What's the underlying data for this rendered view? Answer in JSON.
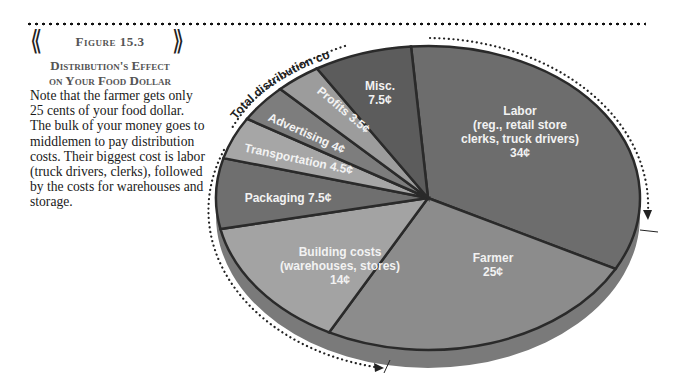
{
  "figure": {
    "label": "Figure 15.3",
    "title_line1": "Distribution's Effect",
    "title_line2": "on Your Food Dollar",
    "body": "Note that the farmer gets only 25 cents of your food dollar. The bulk of your money goes to middlemen to pay distribution costs. Their biggest cost is labor (truck drivers, clerks), followed by the costs for warehouses and storage."
  },
  "annotation": {
    "total_distribution": "Total distribution costs = 75¢"
  },
  "chart_data": {
    "type": "pie",
    "title": "Distribution's Effect on Your Food Dollar",
    "unit": "cents",
    "total": 100,
    "slices": [
      {
        "name": "Labor (reg., retail store clerks, truck drivers)",
        "value": 34,
        "label_lines": [
          "Labor",
          "(reg., retail store",
          "clerks, truck drivers)",
          "34¢"
        ],
        "color": "#6d6d6d"
      },
      {
        "name": "Farmer",
        "value": 25,
        "label_lines": [
          "Farmer",
          "25¢"
        ],
        "color": "#8c8c8c"
      },
      {
        "name": "Building costs (warehouses, stores)",
        "value": 14,
        "label_lines": [
          "Building costs",
          "(warehouses, stores)",
          "14¢"
        ],
        "color": "#a3a3a3"
      },
      {
        "name": "Packaging",
        "value": 7.5,
        "label_lines": [
          "Packaging 7.5¢"
        ],
        "color": "#6f6f6f"
      },
      {
        "name": "Transportation",
        "value": 4.5,
        "label_lines": [
          "Transportation 4.5¢"
        ],
        "color": "#a6a6a6"
      },
      {
        "name": "Advertising",
        "value": 4,
        "label_lines": [
          "Advertising 4¢"
        ],
        "color": "#7d7d7d"
      },
      {
        "name": "Profits",
        "value": 3.5,
        "label_lines": [
          "Profits 3.5¢"
        ],
        "color": "#9c9c9c"
      },
      {
        "name": "Misc.",
        "value": 7.5,
        "label_lines": [
          "Misc.",
          "7.5¢"
        ],
        "color": "#5c5c5c"
      }
    ],
    "annotations": [
      "Total distribution costs = 75¢"
    ],
    "legend": "none"
  }
}
